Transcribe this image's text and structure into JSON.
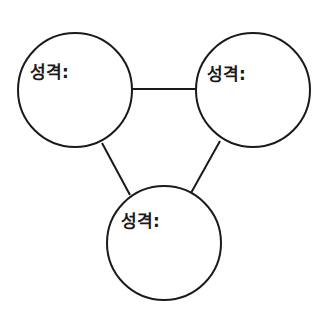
{
  "diagram": {
    "stroke_color": "#1a1a1a",
    "background": "#ffffff",
    "nodes": [
      {
        "id": "top-left",
        "label": "성격:",
        "cx": 75,
        "cy": 90,
        "r": 57
      },
      {
        "id": "top-right",
        "label": "성격:",
        "cx": 253,
        "cy": 90,
        "r": 57
      },
      {
        "id": "bottom",
        "label": "성격:",
        "cx": 164,
        "cy": 243,
        "r": 57
      }
    ],
    "edges": [
      {
        "from": "top-left",
        "to": "top-right"
      },
      {
        "from": "top-left",
        "to": "bottom"
      },
      {
        "from": "top-right",
        "to": "bottom"
      }
    ]
  }
}
